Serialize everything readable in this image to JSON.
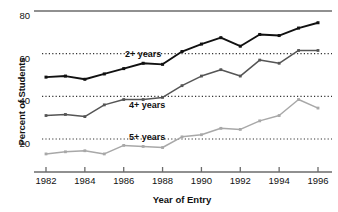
{
  "chart_data": {
    "type": "line",
    "title": "",
    "xlabel": "Year of Entry",
    "ylabel": "Percent of Students",
    "x": [
      1982,
      1983,
      1984,
      1985,
      1986,
      1987,
      1988,
      1989,
      1990,
      1991,
      1992,
      1993,
      1994,
      1995,
      1996
    ],
    "xtick_labels": [
      "1982",
      "1984",
      "1986",
      "1988",
      "1990",
      "1992",
      "1994",
      "1996"
    ],
    "xticks": [
      1982,
      1984,
      1986,
      1988,
      1990,
      1992,
      1994,
      1996
    ],
    "ytick_labels": [
      "80",
      "60",
      "40",
      "20"
    ],
    "yticks": [
      80,
      60,
      40,
      20
    ],
    "xlim": [
      1981.2,
      1996.9
    ],
    "ylim": [
      6,
      82
    ],
    "grid": "horizontal-dotted",
    "legend": "inline-annotations",
    "series": [
      {
        "name": "2+ years",
        "color": "#111111",
        "label_x": 1987.0,
        "label_y": 58.5,
        "values": [
          49,
          49.5,
          48,
          50.5,
          53,
          55.5,
          55,
          61,
          64.5,
          67.5,
          63.5,
          69,
          68.5,
          72,
          74.5
        ]
      },
      {
        "name": "4+ years",
        "color": "#555555",
        "label_x": 1987.2,
        "label_y": 34.5,
        "values": [
          31,
          31.5,
          30.5,
          36,
          38.5,
          38.5,
          39.5,
          45,
          49.5,
          52.5,
          49.5,
          57,
          55.5,
          61.5,
          61.5
        ]
      },
      {
        "name": "5+ years",
        "color": "#a8a8a8",
        "label_x": 1987.2,
        "label_y": 19.5,
        "values": [
          13,
          14,
          14.5,
          13,
          17,
          16.5,
          16,
          21,
          22,
          25,
          24.5,
          28.5,
          31,
          38.5,
          34.5
        ]
      }
    ]
  },
  "axes": {
    "top_rule_value": 80,
    "gridline_values": [
      60,
      40,
      20
    ]
  }
}
